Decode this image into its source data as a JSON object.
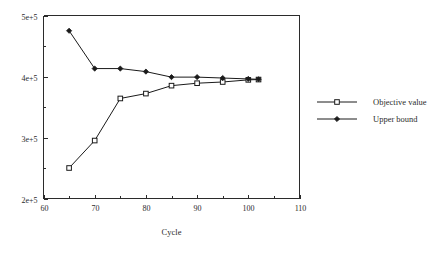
{
  "chart_data": {
    "type": "line",
    "title": "",
    "xlabel": "Cycle",
    "ylabel": "",
    "xlim": [
      60,
      110
    ],
    "ylim": [
      200000,
      500000
    ],
    "grid": false,
    "legend_position": "right",
    "x_ticks": [
      60,
      70,
      80,
      90,
      100,
      110
    ],
    "x_tick_labels": [
      "60",
      "70",
      "80",
      "90",
      "100",
      "110"
    ],
    "x_minor_ticks": [
      65,
      75,
      85,
      95,
      105
    ],
    "y_ticks": [
      200000,
      300000,
      400000,
      500000
    ],
    "y_tick_labels": [
      "2e+5",
      "3e+5",
      "4e+5",
      "5e+5"
    ],
    "y_minor_ticks": [
      250000,
      350000,
      450000
    ],
    "series": [
      {
        "name": "Objective value",
        "marker": "open-square",
        "x": [
          65,
          70,
          75,
          80,
          85,
          90,
          95,
          100,
          102
        ],
        "values": [
          250000,
          295000,
          364000,
          372000,
          385000,
          389000,
          391000,
          394500,
          395000
        ]
      },
      {
        "name": "Upper bound",
        "marker": "filled-diamond",
        "x": [
          65,
          70,
          75,
          80,
          85,
          90,
          95,
          100,
          102
        ],
        "values": [
          475000,
          413000,
          413000,
          408000,
          399000,
          399000,
          397500,
          396000,
          395500
        ]
      }
    ]
  },
  "legend": {
    "entries": [
      {
        "label": "Objective value",
        "marker": "open-square"
      },
      {
        "label": "Upper bound",
        "marker": "filled-diamond"
      }
    ]
  },
  "axis": {
    "x_title": "Cycle"
  }
}
